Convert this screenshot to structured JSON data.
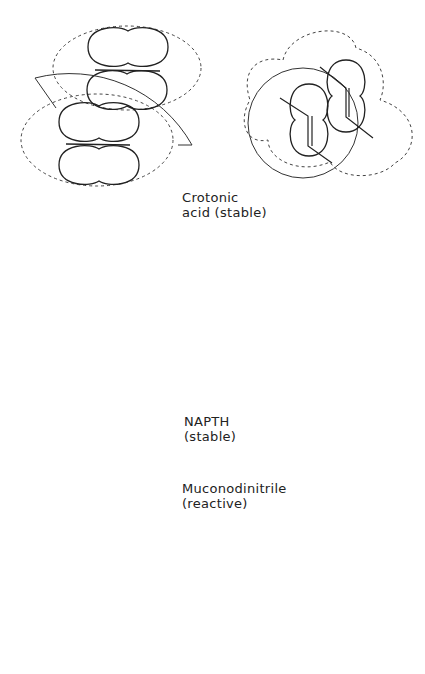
{
  "figure": {
    "panels": [
      {
        "name": "crotonic-acid",
        "label_line1": "Crotonic",
        "label_line2": "acid (stable)",
        "stability": "stable"
      },
      {
        "name": "napth",
        "label_line1": "NAPTH",
        "label_line2": "(stable)",
        "stability": "stable"
      },
      {
        "name": "muconodinitrile",
        "label_line1": "Muconodinitrile",
        "label_line2": "(reactive)",
        "stability": "reactive"
      }
    ]
  }
}
